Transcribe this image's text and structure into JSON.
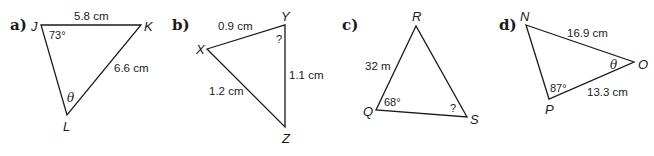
{
  "problems": [
    {
      "label": "a)",
      "vertices": {
        "J": "J",
        "K": "K",
        "L": "L"
      },
      "side_JK": "5.8 cm",
      "side_KL": "6.6 cm",
      "angle_J": "73°",
      "angle_L": "θ"
    },
    {
      "label": "b)",
      "vertices": {
        "X": "X",
        "Y": "Y",
        "Z": "Z"
      },
      "side_XY": "0.9 cm",
      "side_YZ": "1.1 cm",
      "side_XZ": "1.2 cm",
      "angle_Y": "?"
    },
    {
      "label": "c)",
      "vertices": {
        "R": "R",
        "Q": "Q",
        "S": "S"
      },
      "side_QR": "32 m",
      "angle_Q": "68°",
      "angle_S": "?"
    },
    {
      "label": "d)",
      "vertices": {
        "N": "N",
        "O": "O",
        "P": "P"
      },
      "side_NO": "16.9 cm",
      "side_PO": "13.3 cm",
      "angle_P": "87°",
      "angle_O": "θ"
    }
  ]
}
